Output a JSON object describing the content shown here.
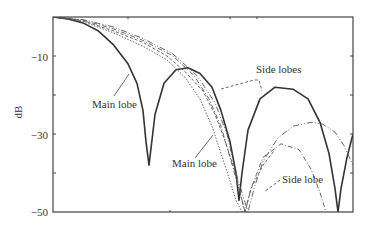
{
  "chart_data": {
    "type": "line",
    "title": "",
    "xlabel": "",
    "ylabel": "dB",
    "ylim": [
      -50,
      0
    ],
    "xlim": [
      0,
      1
    ],
    "y_ticks": [
      -10,
      -20,
      -30,
      -40,
      -50
    ],
    "y_tick_labels": [
      "-10",
      "",
      "-30",
      "",
      "-50"
    ],
    "x_ticks_top": [
      0.25,
      0.59,
      0.68
    ],
    "x_ticks_bottom": [
      0.39
    ],
    "grid": false,
    "legend": "none",
    "series": [
      {
        "name": "solid",
        "style": "solid",
        "x": [
          0,
          0.05,
          0.1,
          0.15,
          0.2,
          0.25,
          0.28,
          0.3,
          0.31,
          0.32,
          0.34,
          0.37,
          0.41,
          0.45,
          0.49,
          0.53,
          0.56,
          0.59,
          0.61,
          0.62,
          0.63,
          0.65,
          0.69,
          0.74,
          0.8,
          0.85,
          0.89,
          0.92,
          0.94,
          0.95,
          0.96,
          0.98,
          1.0
        ],
        "values": [
          0,
          -0.5,
          -1.5,
          -3.5,
          -7,
          -12,
          -17,
          -24,
          -32,
          -38,
          -25,
          -17,
          -13.5,
          -13,
          -14.5,
          -18,
          -24,
          -32,
          -40,
          -47,
          -40,
          -29,
          -21,
          -18,
          -18.5,
          -21,
          -27,
          -35,
          -44,
          -50,
          -44,
          -36,
          -30
        ]
      },
      {
        "name": "dashed-1",
        "style": "dashed",
        "x": [
          0,
          0.1,
          0.2,
          0.3,
          0.38,
          0.44,
          0.5,
          0.54,
          0.57,
          0.6,
          0.62,
          0.64,
          0.66,
          0.7,
          0.74
        ],
        "values": [
          0,
          -1,
          -3.5,
          -6.5,
          -10,
          -14,
          -19,
          -25,
          -31,
          -38,
          -44,
          -50,
          -44,
          -38,
          -34
        ]
      },
      {
        "name": "dashed-2",
        "style": "dotted",
        "x": [
          0,
          0.1,
          0.2,
          0.3,
          0.38,
          0.44,
          0.49,
          0.53,
          0.56,
          0.59,
          0.61,
          0.63
        ],
        "values": [
          0,
          -1.2,
          -4,
          -7.5,
          -11,
          -15.5,
          -21,
          -28,
          -35,
          -42,
          -47,
          -50
        ]
      },
      {
        "name": "dash-dot-1",
        "style": "dashdot",
        "x": [
          0,
          0.1,
          0.2,
          0.3,
          0.4,
          0.47,
          0.52,
          0.56,
          0.59,
          0.62,
          0.64,
          0.66,
          0.7,
          0.76,
          0.82,
          0.86,
          0.89,
          0.91
        ],
        "values": [
          0,
          -0.8,
          -3,
          -6,
          -10,
          -15,
          -21,
          -28,
          -36,
          -44,
          -50,
          -44,
          -36,
          -32.5,
          -34,
          -39,
          -45,
          -50
        ]
      },
      {
        "name": "dash-dot-2",
        "style": "dashdot2",
        "x": [
          0,
          0.1,
          0.2,
          0.3,
          0.4,
          0.48,
          0.54,
          0.58,
          0.61,
          0.65,
          0.67,
          0.7,
          0.75,
          0.8,
          0.86,
          0.9,
          0.94,
          0.97,
          1.0
        ],
        "values": [
          0,
          -0.7,
          -2.5,
          -5.5,
          -9.5,
          -15,
          -22,
          -30,
          -40,
          -50,
          -44,
          -37,
          -31,
          -28,
          -27,
          -27.5,
          -29.5,
          -33,
          -38
        ]
      }
    ],
    "annotations": [
      {
        "text": "Main lobe",
        "target": "solid first lobe"
      },
      {
        "text": "Side lobes",
        "target": "solid second and third lobes"
      },
      {
        "text": "Main lobe",
        "target": "inner curves"
      },
      {
        "text": "Side lobe",
        "target": "dash-dot side lobe"
      }
    ]
  }
}
